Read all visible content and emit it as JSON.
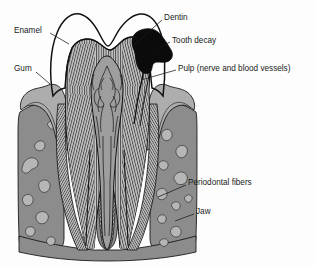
{
  "figure": {
    "background_color": "#fdfdfd",
    "line_color": "#111111",
    "text_color": "#1b1b1b"
  },
  "colors": {
    "enamel": "#ffffff",
    "dentin": "#c9c9c9",
    "dentin_hatch": "#3a3a3a",
    "pulp": "#9e9e9e",
    "decay": "#0b0b0b",
    "gum": "#adadad",
    "jaw_bone": "#8c8c8c",
    "bone_cavity": "#b6b6b6",
    "periodontal_fibers": "#bdbdbd",
    "outline": "#111111"
  },
  "labels": [
    {
      "id": "enamel",
      "text": "Enamel",
      "text_x": 14,
      "text_y": 31,
      "anchor": "start",
      "leader": "M 50 33 L 69 44"
    },
    {
      "id": "gum",
      "text": "Gum",
      "text_x": 14,
      "text_y": 69,
      "anchor": "start",
      "leader": "M 36 72 L 50 83"
    },
    {
      "id": "dentin",
      "text": "Dentin",
      "text_x": 164,
      "text_y": 18,
      "anchor": "start",
      "leader": "M 162 20 L 135 44"
    },
    {
      "id": "tooth-decay",
      "text": "Tooth decay",
      "text_x": 172,
      "text_y": 41,
      "anchor": "start",
      "leader": "M 170 42 L 158 50"
    },
    {
      "id": "pulp",
      "text": "Pulp (nerve and blood vessels)",
      "text_x": 178,
      "text_y": 69,
      "anchor": "start",
      "leader": "M 176 70 L 142 80"
    },
    {
      "id": "periodontal-fibers",
      "text": "Periodontal fibers",
      "text_x": 188,
      "text_y": 183,
      "anchor": "start",
      "leader": "M 186 185 L 160 196"
    },
    {
      "id": "jaw",
      "text": "Jaw",
      "text_x": 196,
      "text_y": 212,
      "anchor": "start",
      "leader": "M 194 214 L 176 221"
    }
  ],
  "anatomy": {
    "crown_outline": "M 53 95 C 49 72 50 48 57 31 C 62 18 71 11 80 13 C 88 15 95 24 100 34 C 104 42 106 44 108 44 C 110 44 112 41 116 34 C 122 23 131 14 140 13 C 149 12 157 20 161 33 C 165 47 166 72 163 95 Z",
    "decay_shape": "M 138 33 C 146 28 154 29 159 33 C 164 37 167 44 170 49 C 172 53 171 58 167 60 C 163 62 159 60 156 62 C 153 64 154 69 150 71 C 146 73 141 70 139 65 C 137 60 138 55 136 51 C 134 47 133 42 135 38 Z",
    "pulp_chamber": "M 100 78 C 96 84 94 94 95 104 C 96 118 99 130 100 144 C 101 160 100 178 101 196 C 102 208 104 216 107 220 C 110 216 112 208 113 196 C 114 178 113 160 114 144 C 115 130 118 118 119 104 C 120 94 118 84 114 78 Z",
    "root_count": 2
  }
}
